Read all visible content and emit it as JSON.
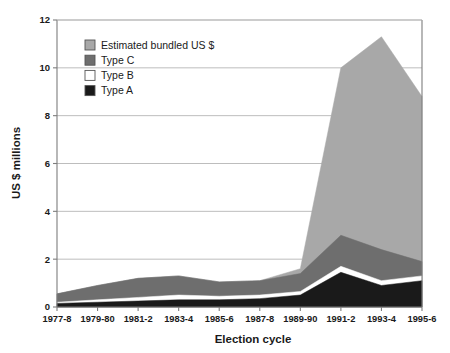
{
  "chart_data": {
    "type": "area",
    "title": "",
    "xlabel": "Election cycle",
    "ylabel": "US $ millions",
    "ylim": [
      0,
      12
    ],
    "yticks": [
      0,
      2,
      4,
      6,
      8,
      10,
      12
    ],
    "ytick_labels": [
      "0",
      "2",
      "4",
      "6",
      "8",
      "10",
      "12"
    ],
    "grid": true,
    "stacked": true,
    "legend_position": "top-left-inside",
    "categories": [
      "1977-8",
      "1979-80",
      "1981-2",
      "1983-4",
      "1985-6",
      "1987-8",
      "1989-90",
      "1991-2",
      "1993-4",
      "1995-6"
    ],
    "series": [
      {
        "name": "Type A",
        "color": "#1a1a1a",
        "values": [
          0.15,
          0.2,
          0.25,
          0.3,
          0.3,
          0.35,
          0.5,
          1.45,
          0.9,
          1.1
        ]
      },
      {
        "name": "Type B",
        "color": "#ffffff",
        "values": [
          0.05,
          0.1,
          0.15,
          0.2,
          0.15,
          0.15,
          0.15,
          0.25,
          0.2,
          0.2
        ]
      },
      {
        "name": "Type C",
        "color": "#6e6e6e",
        "values": [
          0.35,
          0.6,
          0.8,
          0.8,
          0.6,
          0.6,
          0.75,
          1.3,
          1.3,
          0.6
        ]
      },
      {
        "name": "Estimated bundled US $",
        "color": "#a8a8a8",
        "values": [
          0.0,
          0.0,
          0.0,
          0.0,
          0.0,
          0.0,
          0.2,
          7.0,
          8.9,
          6.9
        ]
      }
    ],
    "series_totals": [
      0.55,
      0.9,
      1.2,
      1.3,
      1.05,
      1.1,
      1.6,
      10.0,
      11.3,
      8.8
    ],
    "legend": [
      {
        "label": "Estimated bundled US $",
        "color": "#a8a8a8"
      },
      {
        "label": "Type C",
        "color": "#6e6e6e"
      },
      {
        "label": "Type B",
        "color": "#ffffff"
      },
      {
        "label": "Type A",
        "color": "#1a1a1a"
      }
    ],
    "axis_color": "#7d7d7d",
    "grid_color": "#b5b5b5"
  }
}
